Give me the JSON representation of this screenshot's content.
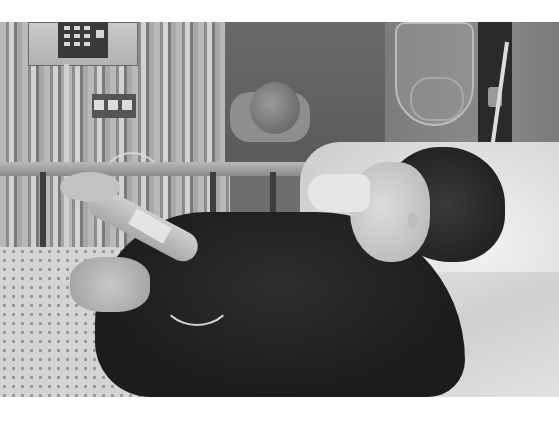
{
  "image": {
    "type": "photograph",
    "color_mode": "grayscale",
    "description": "A young woman with short dark hair lies in a hospital bed wearing a nasal oxygen cannula, holding IV tubing, with an IV pump and IV bags beside the bed and another patient visible in the background.",
    "frame": {
      "top_margin_px": 22,
      "bottom_margin_px": 24,
      "margin_color": "#ffffff"
    },
    "elements": [
      "iv-pump",
      "iv-pole",
      "iv-bags",
      "curtain",
      "bed-rail",
      "background-patient",
      "pillow",
      "patient-head",
      "oxygen-mask",
      "dark-sweater",
      "hospital-gown",
      "bed-sheets"
    ]
  }
}
